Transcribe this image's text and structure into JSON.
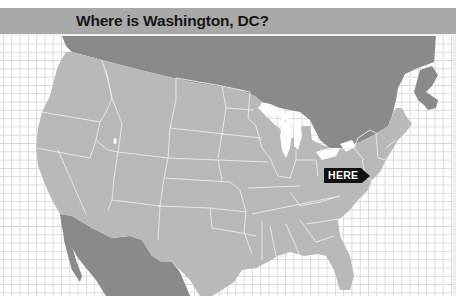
{
  "header": {
    "title": "Where is Washington, DC?"
  },
  "marker": {
    "label": "HERE",
    "points_to": "Washington, DC"
  },
  "map": {
    "regions": [
      "Canada",
      "United States",
      "Mexico"
    ],
    "colors": {
      "us": "#b9b9b9",
      "canada": "#8a8a8a",
      "mexico": "#8a8a8a",
      "state_borders": "#eeeeee",
      "water": "#ffffff",
      "grid": "#d8d8d8",
      "title_bar": "#a9a9a9"
    }
  }
}
